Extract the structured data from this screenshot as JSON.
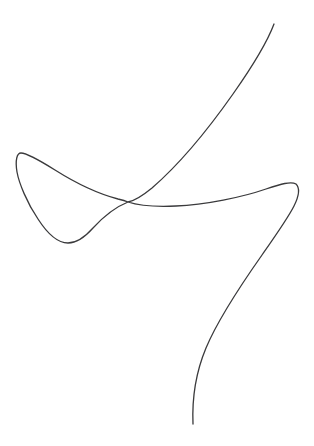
{
  "canvas": {
    "width": 314,
    "height": 446,
    "background_color": "#ffffff",
    "description": "single continuous self-intersecting freehand curve on blank white background"
  },
  "figure": {
    "name": "self-intersecting-open-curve",
    "stroke_color": "#3a3a3c",
    "stroke_width": 1.3,
    "fill": "none",
    "path_d": "M 274 24 C 268 40 252 67 233 94 C 214 121 182 162 152 188 C 141 197 134 201 128 202 C 118 206 104 216 93 228 C 85 237 76 243 68 243 C 58 243 47 233 38 219 C 27 203 19 183 17 172 C 15 160 17 153 21 153 C 27 153 39 160 55 170 C 74 182 99 194 118 199 C 123 200 126 201 128 202 C 137 205 154 207 176 206 C 205 205 243 197 266 189 C 281 184 291 181 296 184 C 300 188 299 196 294 206 C 288 218 276 235 262 255 C 243 282 219 317 206 348 C 196 372 192 400 193 424"
  },
  "annotations": {
    "top_endpoint": {
      "x": 274,
      "y": 24
    },
    "bottom_endpoint": {
      "x": 193,
      "y": 424
    },
    "crossing_point": {
      "x": 128,
      "y": 202
    },
    "left_loop_peak": {
      "x": 20,
      "y": 153
    },
    "left_loop_bottom": {
      "x": 68,
      "y": 243
    },
    "rightmost_extent": {
      "x": 298,
      "y": 188
    }
  }
}
